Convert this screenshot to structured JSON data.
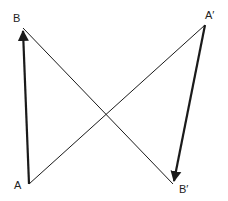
{
  "diagram": {
    "width": 228,
    "height": 201,
    "colors": {
      "background": "#ffffff",
      "stroke": "#1a1a1a",
      "label": "#222222"
    },
    "points": {
      "A": {
        "x": 29,
        "y": 184
      },
      "B": {
        "x": 23,
        "y": 28
      },
      "A_prime": {
        "x": 205,
        "y": 25
      },
      "B_prime": {
        "x": 173,
        "y": 184
      }
    },
    "labels": {
      "A": "A",
      "B": "B",
      "A_prime": "A′",
      "B_prime": "B′"
    },
    "segments": [
      {
        "name": "vector-AB",
        "from": "A",
        "to": "B",
        "style": "thick-arrow"
      },
      {
        "name": "vector-A'B'",
        "from": "A_prime",
        "to": "B_prime",
        "style": "thick-arrow"
      },
      {
        "name": "line-BB'",
        "from": "B",
        "to": "B_prime",
        "style": "thin"
      },
      {
        "name": "line-AA'",
        "from": "A",
        "to": "A_prime",
        "style": "thin"
      }
    ]
  }
}
